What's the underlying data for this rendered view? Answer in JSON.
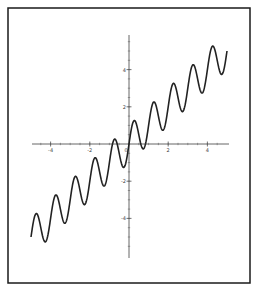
{
  "chart_data": {
    "type": "line",
    "title": "",
    "xlabel": "",
    "ylabel": "",
    "function": "y = x + sin(2*pi*x)",
    "xlim": [
      -5,
      5
    ],
    "ylim": [
      -6,
      6
    ],
    "grid": false,
    "legend": null,
    "x_ticks": [
      -4,
      -2,
      0,
      2,
      4
    ],
    "x_tick_labels": [
      "-4",
      "-2",
      "0",
      "2",
      "4"
    ],
    "y_ticks": [
      -4,
      -2,
      2,
      4
    ],
    "y_tick_labels": [
      "-4",
      "-2",
      "2",
      "4"
    ],
    "series": [
      {
        "name": "f(x)",
        "color": "#222222",
        "x": [
          -5,
          -4.75,
          -4.25,
          -3.75,
          -3.25,
          -2.75,
          -2.25,
          -1.75,
          -1.25,
          -0.75,
          -0.25,
          0.25,
          0.75,
          1.25,
          1.75,
          2.25,
          2.75,
          3.25,
          3.75,
          4.25,
          4.75,
          5
        ],
        "values": [
          -5,
          -5.75,
          -3.25,
          -4.75,
          -2.25,
          -3.75,
          -1.25,
          -2.75,
          -0.25,
          -1.75,
          0.75,
          1.25,
          -0.25,
          2.25,
          0.75,
          3.25,
          1.75,
          4.25,
          2.75,
          5.25,
          5.75,
          5
        ]
      }
    ]
  },
  "frame": {
    "border_color": "#1a1a1a",
    "axis_color": "#555555",
    "curve_color": "#222222"
  }
}
